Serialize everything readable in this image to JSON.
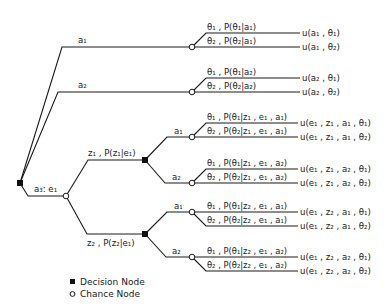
{
  "diagram": {
    "type": "decision-tree",
    "colors": {
      "line": "#1a1a1a",
      "background": "#ffffff"
    },
    "root": {
      "node_type": "decision"
    },
    "actions": {
      "a1": "a₁",
      "a2": "a₂",
      "a3": "a₃: e₁"
    },
    "branch_a1": {
      "label": "a₁",
      "theta1": "θ₁ , P(θ₁|a₁)",
      "theta2": "θ₂ , P(θ₂|a₁)",
      "u1": "u(a₁ , θ₁)",
      "u2": "u(a₁ , θ₂)"
    },
    "branch_a2": {
      "label": "a₂",
      "theta1": "θ₁ , P(θ₁|a₂)",
      "theta2": "θ₂ , P(θ₂|a₂)",
      "u1": "u(a₂ , θ₁)",
      "u2": "u(a₂ , θ₂)"
    },
    "branch_a3": {
      "label": "a₃: e₁",
      "z1": {
        "label": "z₁ , P(z₁|e₁)",
        "a1": {
          "label": "a₁",
          "theta1": "θ₁ , P(θ₁|z₁ , e₁ , a₁)",
          "theta2": "θ₂ , P(θ₂|z₁ , e₁ , a₁)",
          "u1": "u(e₁ , z₁ , a₁ , θ₁)",
          "u2": "u(e₁ , z₁ , a₁ , θ₂)"
        },
        "a2": {
          "label": "a₂",
          "theta1": "θ₁ , P(θ₁|z₁ , e₁ , a₂)",
          "theta2": "θ₂ , P(θ₂|z₁ , e₁ , a₂)",
          "u1": "u(e₁ , z₁ , a₂ , θ₁)",
          "u2": "u(e₁ , z₁ , a₂ , θ₂)"
        }
      },
      "z2": {
        "label": "z₂ , P(z₂|e₁)",
        "a1": {
          "label": "a₁",
          "theta1": "θ₁ , P(θ₁|z₂ , e₁ , a₁)",
          "theta2": "θ₂ , P(θ₂|z₂ , e₁ , a₁)",
          "u1": "u(e₁ , z₂ , a₁ , θ₁)",
          "u2": "u(e₁ , z₂ , a₁ , θ₂)"
        },
        "a2": {
          "label": "a₂",
          "theta1": "θ₁ , P(θ₁|z₂ , e₁ , a₂)",
          "theta2": "θ₂ , P(θ₂|z₂ , e₁ , a₂)",
          "u1": "u(e₁ , z₂ , a₂ , θ₁)",
          "u2": "u(e₁ , z₂ , a₂ , θ₂)"
        }
      }
    },
    "legend": {
      "decision": {
        "symbol": "filled-square",
        "label": "Decision Node"
      },
      "chance": {
        "symbol": "open-circle",
        "label": "Chance Node"
      }
    }
  }
}
